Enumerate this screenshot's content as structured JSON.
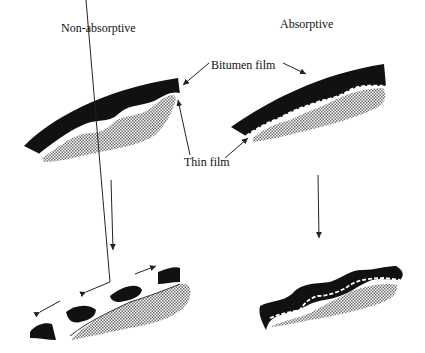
{
  "diagram": {
    "panels": {
      "left": {
        "title": "Non-absorptive",
        "substrate_type": "non-absorptive"
      },
      "right": {
        "title": "Absorptive",
        "substrate_type": "absorptive"
      }
    },
    "labels": {
      "bitumen_film": "Bitumen film",
      "thin_film": "Thin film"
    },
    "colors": {
      "bitumen": "#111111",
      "substrate_hatch": "#9a9a9a",
      "background": "#ffffff",
      "line": "#222222"
    }
  }
}
